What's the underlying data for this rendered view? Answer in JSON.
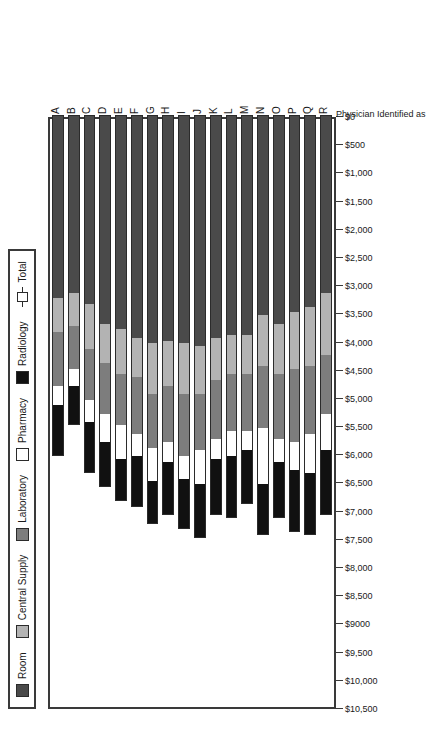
{
  "chart_data": {
    "type": "bar",
    "orientation": "horizontal-stacked",
    "title": "",
    "xlabel": "Physician Identified as",
    "ylabel": "",
    "xlim": [
      0,
      10500
    ],
    "grid": false,
    "legend_position": "top",
    "categories": [
      "A",
      "B",
      "C",
      "D",
      "E",
      "F",
      "G",
      "H",
      "I",
      "J",
      "K",
      "L",
      "M",
      "N",
      "O",
      "P",
      "Q",
      "R"
    ],
    "tick_labels": [
      "$0",
      "$500",
      "$1,000",
      "$1,500",
      "$2,000",
      "$2,500",
      "$3,000",
      "$3,500",
      "$4,000",
      "$4,500",
      "$5,000",
      "$5,500",
      "$6,000",
      "$6,500",
      "$7,000",
      "$7,500",
      "$8,000",
      "$8,500",
      "$9000",
      "$9,500",
      "$10,000",
      "$10,500"
    ],
    "tick_values": [
      0,
      500,
      1000,
      1500,
      2000,
      2500,
      3000,
      3500,
      4000,
      4500,
      5000,
      5500,
      6000,
      6500,
      7000,
      7500,
      8000,
      8500,
      9000,
      9500,
      10000,
      10500
    ],
    "series": [
      {
        "name": "Room",
        "color": "#4a4a4a",
        "values": [
          3250,
          3150,
          3350,
          3700,
          3800,
          3950,
          4050,
          4000,
          4050,
          4100,
          3950,
          3900,
          3900,
          3550,
          3700,
          3500,
          3400,
          3150
        ]
      },
      {
        "name": "Central Supply",
        "color": "#b3b3b3",
        "values": [
          600,
          600,
          800,
          700,
          800,
          700,
          900,
          800,
          900,
          850,
          750,
          700,
          700,
          900,
          900,
          1000,
          1050,
          1100
        ]
      },
      {
        "name": "Laboratory",
        "color": "#7d7d7d",
        "values": [
          950,
          750,
          900,
          900,
          900,
          1000,
          950,
          1000,
          1100,
          1000,
          1050,
          1000,
          1000,
          1100,
          1150,
          1300,
          1200,
          1050
        ]
      },
      {
        "name": "Pharmacy",
        "color": "#ffffff",
        "values": [
          350,
          300,
          400,
          500,
          600,
          400,
          600,
          350,
          400,
          600,
          350,
          450,
          350,
          1000,
          400,
          500,
          700,
          650
        ]
      },
      {
        "name": "Radiology",
        "color": "#111111",
        "values": [
          900,
          700,
          900,
          800,
          750,
          900,
          750,
          950,
          900,
          950,
          1000,
          1100,
          950,
          900,
          1000,
          1100,
          1100,
          1150
        ]
      }
    ],
    "totals": [
      6050,
      5500,
      6350,
      6600,
      6850,
      6950,
      7250,
      7100,
      7350,
      7500,
      7100,
      7150,
      6900,
      7450,
      7150,
      7400,
      7450,
      7100
    ]
  },
  "legend": {
    "items": [
      {
        "label": "Room",
        "swatch": "room"
      },
      {
        "label": "Central Supply",
        "swatch": "central"
      },
      {
        "label": "Laboratory",
        "swatch": "lab"
      },
      {
        "label": "Pharmacy",
        "swatch": "pharm"
      },
      {
        "label": "Radiology",
        "swatch": "radio"
      },
      {
        "label": "Total",
        "swatch": "total"
      }
    ]
  },
  "axis": {
    "x_title": "Physician Identified as"
  }
}
